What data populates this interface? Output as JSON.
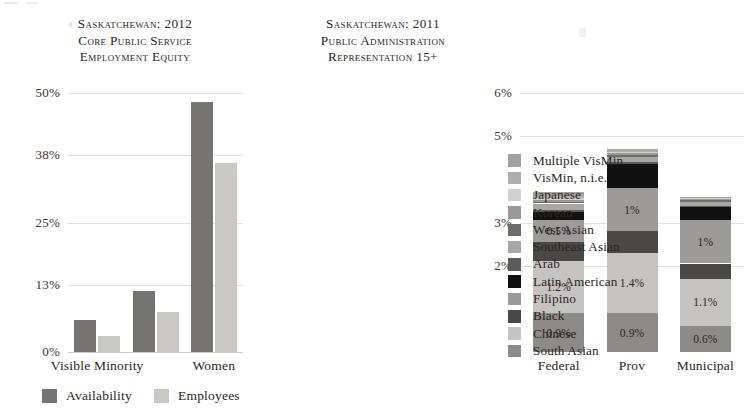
{
  "page": {
    "background": "#ffffff",
    "text_color": "#231f20"
  },
  "left_chart": {
    "title": "Saskatchewan: 2012\nCore Public Service\nEmployment Equity",
    "legend": [
      {
        "label": "Availability",
        "color": "#767472"
      },
      {
        "label": "Employees",
        "color": "#c9c7c4"
      }
    ]
  },
  "right_chart": {
    "title": "Saskatchewan: 2011\nPublic Administration\nRepresentation 15+"
  },
  "legend_right": {
    "items": [
      {
        "label": "Multiple VisMin",
        "color": "#a3a1a0"
      },
      {
        "label": "VisMin, n.i.e.",
        "color": "#b0aeac"
      },
      {
        "label": "Japanese",
        "color": "#d2d1cf"
      },
      {
        "label": "Korean",
        "color": "#9b9997"
      },
      {
        "label": "West Asian",
        "color": "#6f6d6b"
      },
      {
        "label": "Southeast Asian",
        "color": "#a9a7a5"
      },
      {
        "label": "Arab",
        "color": "#5e5c5a"
      },
      {
        "label": "Latin American",
        "color": "#111111"
      },
      {
        "label": "Filipino",
        "color": "#9d9b99"
      },
      {
        "label": "Black",
        "color": "#4a4846"
      },
      {
        "label": "Chinese",
        "color": "#c6c4c2"
      },
      {
        "label": "South Asian",
        "color": "#8d8b89"
      }
    ]
  },
  "chart_data": [
    {
      "type": "bar",
      "id": "sk-2012-core-public-service-employment-equity",
      "title": "Saskatchewan: 2012 Core Public Service Employment Equity",
      "xlabel": "",
      "ylabel": "",
      "ylim": [
        0,
        50
      ],
      "yunit": "%",
      "ytick_labels": [
        "0%",
        "13%",
        "25%",
        "38%",
        "50%"
      ],
      "ytick_values": [
        0,
        13,
        25,
        38,
        50
      ],
      "grid": true,
      "legend_position": "bottom",
      "categories": [
        "Visible Minority",
        "",
        "Women"
      ],
      "series": [
        {
          "name": "Availability",
          "color": "#767472",
          "values": [
            6.1,
            11.8,
            48.2
          ]
        },
        {
          "name": "Employees",
          "color": "#c9c7c4",
          "values": [
            3.1,
            7.7,
            36.4
          ]
        }
      ]
    },
    {
      "type": "bar",
      "id": "sk-2011-public-administration-representation-15plus",
      "subtype": "stacked",
      "title": "Saskatchewan: 2011 Public Administration Representation 15+",
      "xlabel": "",
      "ylabel": "",
      "ylim": [
        0,
        6
      ],
      "yunit": "%",
      "ytick_labels": [
        "2%",
        "3%",
        "5%",
        "6%"
      ],
      "ytick_values": [
        2,
        3,
        5,
        6
      ],
      "grid": true,
      "legend_position": "right",
      "categories": [
        "Federal",
        "Prov",
        "Municipal"
      ],
      "totals": [
        3.7,
        5.5,
        3.6
      ],
      "series": [
        {
          "name": "South Asian",
          "color": "#8d8b89",
          "values": [
            0.9,
            0.9,
            0.6
          ],
          "labels": [
            "0.9%",
            "0.9%",
            "0.6%"
          ]
        },
        {
          "name": "Chinese",
          "color": "#c6c4c2",
          "values": [
            1.2,
            1.4,
            1.1
          ],
          "labels": [
            "1.2%",
            "1.4%",
            "1.1%"
          ]
        },
        {
          "name": "Black",
          "color": "#4a4846",
          "values": [
            0.45,
            0.5,
            0.35
          ],
          "labels": [
            "",
            "",
            ""
          ]
        },
        {
          "name": "Filipino",
          "color": "#9d9b99",
          "values": [
            0.5,
            1.0,
            1.0
          ],
          "labels": [
            "0.5%",
            "1%",
            "1%"
          ]
        },
        {
          "name": "Latin American",
          "color": "#111111",
          "values": [
            0.2,
            0.55,
            0.3
          ],
          "labels": [
            "",
            "",
            ""
          ]
        },
        {
          "name": "Arab",
          "color": "#5e5c5a",
          "values": [
            0.05,
            0.05,
            0.04
          ],
          "labels": [
            "",
            "",
            ""
          ]
        },
        {
          "name": "Southeast Asian",
          "color": "#a9a7a5",
          "values": [
            0.14,
            0.12,
            0.09
          ],
          "labels": [
            "",
            "",
            ""
          ]
        },
        {
          "name": "West Asian",
          "color": "#6f6d6b",
          "values": [
            0.04,
            0.04,
            0.03
          ],
          "labels": [
            "",
            "",
            ""
          ]
        },
        {
          "name": "Korean",
          "color": "#9b9997",
          "values": [
            0.05,
            0.04,
            0.03
          ],
          "labels": [
            "",
            "",
            ""
          ]
        },
        {
          "name": "Japanese",
          "color": "#d2d1cf",
          "values": [
            0.04,
            0.03,
            0.02
          ],
          "labels": [
            "",
            "",
            ""
          ]
        },
        {
          "name": "VisMin, n.i.e.",
          "color": "#b0aeac",
          "values": [
            0.05,
            0.04,
            0.03
          ],
          "labels": [
            "",
            "",
            ""
          ]
        },
        {
          "name": "Multiple VisMin",
          "color": "#a3a1a0",
          "values": [
            0.08,
            0.03,
            0.01
          ],
          "labels": [
            "",
            "",
            ""
          ]
        }
      ]
    }
  ]
}
